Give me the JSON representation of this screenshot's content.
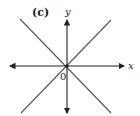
{
  "figure": {
    "panel_label": "(c)",
    "x_axis_label": "x",
    "y_axis_label": "y",
    "origin_label": "0",
    "colors": {
      "axis": "#222222",
      "line": "#555555",
      "text": "#1a1a1a"
    },
    "lines": [
      {
        "name": "positive-slope-line",
        "slope": 1
      },
      {
        "name": "negative-slope-line",
        "slope": -1
      }
    ]
  }
}
